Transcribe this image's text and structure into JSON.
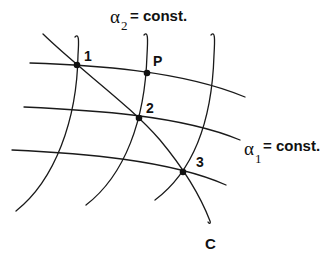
{
  "diagram": {
    "title_top": {
      "symbol": "α",
      "subscript": "2",
      "text": "= const."
    },
    "title_right": {
      "symbol": "α",
      "subscript": "1",
      "text": "= const."
    },
    "points": [
      {
        "id": "1",
        "label": "1"
      },
      {
        "id": "P",
        "label": "P"
      },
      {
        "id": "2",
        "label": "2"
      },
      {
        "id": "3",
        "label": "3"
      }
    ],
    "curve_label": "C",
    "colors": {
      "stroke": "#1a1a1a",
      "background": "#ffffff"
    }
  }
}
